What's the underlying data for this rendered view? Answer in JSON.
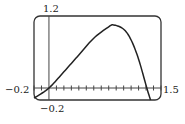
{
  "chart_data": {
    "type": "line",
    "title": "",
    "xlabel": "",
    "ylabel": "",
    "xlim": [
      -0.2,
      1.5
    ],
    "ylim": [
      -0.2,
      1.2
    ],
    "x_tick_step": 0.1,
    "grid": false,
    "window_labels": {
      "xmin": "−0.2",
      "xmax": "1.5",
      "ymin": "−0.2",
      "ymax": "1.2"
    },
    "series": [
      {
        "name": "f(x)",
        "x": [
          -0.2,
          0.0,
          0.2,
          0.4,
          0.6,
          0.8,
          0.87,
          1.0,
          1.1,
          1.2,
          1.31,
          1.36
        ],
        "y": [
          -0.17,
          0.0,
          0.27,
          0.55,
          0.83,
          1.02,
          1.05,
          0.98,
          0.8,
          0.48,
          0.0,
          -0.2
        ]
      }
    ]
  }
}
